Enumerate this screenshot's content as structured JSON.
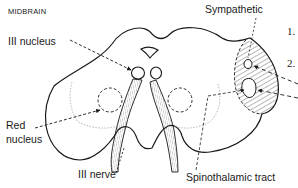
{
  "diagram": {
    "title": "MIDBRAIN",
    "labels": {
      "iii_nucleus": "III nucleus",
      "red_nucleus_line1": "Red",
      "red_nucleus_line2": "nucleus",
      "iii_nerve": "III nerve",
      "sympathetic": "Sympathetic",
      "spinothalamic": "Spinothalamic tract"
    },
    "list_numbers": [
      "1.",
      "2."
    ],
    "colors": {
      "ink": "#1a1a1a",
      "faint": "#9a9a9a",
      "background": "#ffffff"
    }
  }
}
